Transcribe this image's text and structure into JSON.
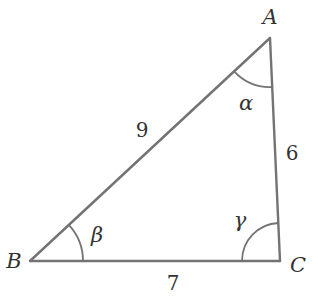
{
  "diagram": {
    "type": "triangle",
    "colors": {
      "stroke": "#737373",
      "text": "#333333",
      "background": "#ffffff"
    },
    "vertices": [
      {
        "id": "A",
        "label": "A",
        "x": 270,
        "y": 38,
        "label_x": 270,
        "label_y": 17
      },
      {
        "id": "B",
        "label": "B",
        "x": 30,
        "y": 261,
        "label_x": 14,
        "label_y": 261
      },
      {
        "id": "C",
        "label": "C",
        "x": 280,
        "y": 261,
        "label_x": 298,
        "label_y": 265
      }
    ],
    "sides": [
      {
        "from": "A",
        "to": "B",
        "label": "9",
        "label_x": 142,
        "label_y": 130
      },
      {
        "from": "B",
        "to": "C",
        "label": "7",
        "label_x": 173,
        "label_y": 283
      },
      {
        "from": "A",
        "to": "C",
        "label": "6",
        "label_x": 292,
        "label_y": 153
      }
    ],
    "angles": [
      {
        "vertex": "A",
        "label": "α",
        "label_x": 246,
        "label_y": 103
      },
      {
        "vertex": "B",
        "label": "β",
        "label_x": 97,
        "label_y": 235
      },
      {
        "vertex": "C",
        "label": "γ",
        "label_x": 240,
        "label_y": 220
      }
    ]
  }
}
